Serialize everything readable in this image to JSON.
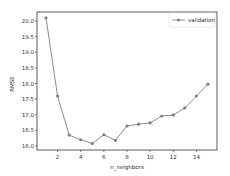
{
  "chart_data": {
    "type": "line",
    "title": "",
    "xlabel": "n_neighbors",
    "ylabel": "RMSE",
    "x": [
      1,
      2,
      3,
      4,
      5,
      6,
      7,
      8,
      9,
      10,
      11,
      12,
      13,
      14,
      15
    ],
    "series": [
      {
        "name": "validation",
        "values": [
          20.1,
          17.6,
          16.35,
          16.2,
          16.08,
          16.36,
          16.18,
          16.64,
          16.7,
          16.74,
          16.96,
          16.99,
          17.22,
          17.6,
          17.98
        ],
        "color": "#808080",
        "marker": "circle"
      }
    ],
    "xticks": [
      2,
      4,
      6,
      8,
      10,
      12,
      14
    ],
    "xtick_labels": [
      "2",
      "4",
      "6",
      "8",
      "10",
      "12",
      "14"
    ],
    "yticks": [
      16.0,
      16.5,
      17.0,
      17.5,
      18.0,
      18.5,
      19.0,
      19.5,
      20.0
    ],
    "ytick_labels": [
      "16.0",
      "16.5",
      "17.0",
      "17.5",
      "18.0",
      "18.5",
      "19.0",
      "19.5",
      "20.0"
    ],
    "xlim": [
      0.3,
      15.7
    ],
    "ylim": [
      15.87,
      20.29
    ],
    "grid": false,
    "legend_position": "upper right"
  }
}
